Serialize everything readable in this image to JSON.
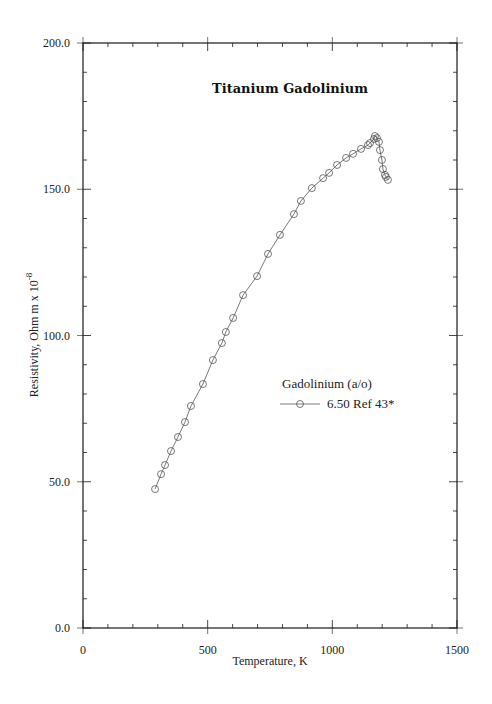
{
  "chart_data": {
    "type": "line",
    "title": "Titanium  Gadolinium",
    "xlabel": "Temperature,  K",
    "ylabel": "Resistivity, Ohm m x 10",
    "ylabel_superscript": "-8",
    "xlim": [
      0,
      1500
    ],
    "ylim": [
      0,
      200
    ],
    "x_ticks": [
      "0",
      "500",
      "1000",
      "1500"
    ],
    "y_ticks": [
      "0.0",
      "50.0",
      "100.0",
      "150.0",
      "200.0"
    ],
    "grid": false,
    "legend": {
      "title": "Gadolinium (a/o)",
      "position": "center-right",
      "entries": [
        "6.50 Ref 43*"
      ]
    },
    "series": [
      {
        "name": "6.50 Ref 43*",
        "marker": "open-circle",
        "x": [
          289,
          313,
          329,
          353,
          381,
          409,
          433,
          481,
          521,
          557,
          573,
          602,
          642,
          698,
          742,
          790,
          846,
          874,
          918,
          963,
          987,
          1019,
          1055,
          1083,
          1115,
          1143,
          1151,
          1167,
          1171,
          1179,
          1187,
          1191,
          1199,
          1203,
          1211,
          1215,
          1223
        ],
        "y": [
          47.5,
          52.6,
          55.7,
          60.5,
          65.3,
          70.4,
          75.9,
          83.4,
          91.6,
          97.4,
          101.2,
          106.0,
          113.8,
          120.3,
          127.9,
          134.4,
          141.5,
          146.0,
          150.4,
          153.8,
          155.6,
          158.3,
          160.7,
          162.1,
          163.8,
          165.1,
          165.8,
          167.2,
          168.2,
          167.5,
          166.2,
          163.4,
          160.0,
          156.9,
          154.9,
          154.2,
          153.2
        ]
      }
    ]
  },
  "colors": {
    "axis": "#1a1a1a",
    "series": "#555555",
    "background": "#ffffff"
  }
}
